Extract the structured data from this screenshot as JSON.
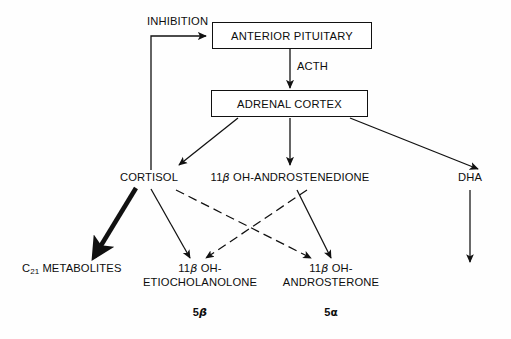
{
  "diagram": {
    "background_color": "#fefefe",
    "line_color": "#111111",
    "boxes": [
      {
        "id": "anterior-pituitary",
        "label": "ANTERIOR PITUITARY"
      },
      {
        "id": "adrenal-cortex",
        "label": "ADRENAL CORTEX"
      }
    ],
    "labels": {
      "inhibition": "INHIBITION",
      "acth": "ACTH",
      "cortisol": "CORTISOL",
      "androstenedione_prefix": "11",
      "androstenedione_beta": "β",
      "androstenedione_rest": " OH-ANDROSTENEDIONE",
      "dha": "DHA",
      "c21_prefix": "C",
      "c21_sub": "21",
      "c21_rest": " METABOLITES",
      "etio_line1_prefix": "11",
      "etio_line1_beta": "β",
      "etio_line1_rest": " OH-",
      "etio_line2": "ETIOCHOLANOLONE",
      "andros_line1_prefix": "11",
      "andros_line1_beta": "β",
      "andros_line1_rest": " OH-",
      "andros_line2": "ANDROSTERONE",
      "five_beta_num": "5",
      "five_beta_greek": "β",
      "five_alpha_num": "5",
      "five_alpha_greek": "α"
    },
    "edges": [
      {
        "id": "feedback-inhibition",
        "from": "cortisol",
        "to": "anterior-pituitary",
        "style": "solid"
      },
      {
        "id": "acth-arrow",
        "from": "anterior-pituitary",
        "to": "adrenal-cortex",
        "style": "solid"
      },
      {
        "id": "cortex-to-cortisol",
        "from": "adrenal-cortex",
        "to": "cortisol",
        "style": "solid"
      },
      {
        "id": "cortex-to-androstenedione",
        "from": "adrenal-cortex",
        "to": "androstenedione",
        "style": "solid"
      },
      {
        "id": "cortex-to-dha",
        "from": "adrenal-cortex",
        "to": "dha",
        "style": "solid"
      },
      {
        "id": "cortisol-to-c21",
        "from": "cortisol",
        "to": "c21-metabolites",
        "style": "thick"
      },
      {
        "id": "cortisol-to-etiocholanolone",
        "from": "cortisol",
        "to": "etiocholanolone",
        "style": "solid"
      },
      {
        "id": "cortisol-to-androsterone",
        "from": "cortisol",
        "to": "androsterone",
        "style": "dashed"
      },
      {
        "id": "androstenedione-to-etiocholanolone",
        "from": "androstenedione",
        "to": "etiocholanolone",
        "style": "dashed"
      },
      {
        "id": "androstenedione-to-androsterone",
        "from": "androstenedione",
        "to": "androsterone",
        "style": "solid"
      },
      {
        "id": "dha-downward",
        "from": "dha",
        "to": "dha-metabolites",
        "style": "solid"
      }
    ]
  }
}
